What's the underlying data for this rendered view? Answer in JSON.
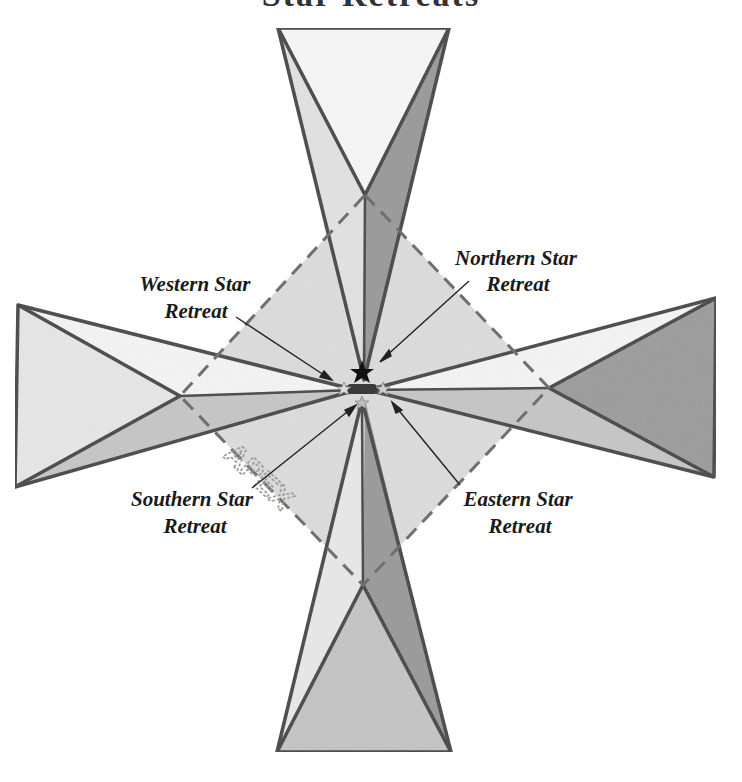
{
  "title": "Star Retreats",
  "diagram": {
    "center": [
      362,
      390
    ],
    "apex_label": "APEX",
    "colors": {
      "outline": "#444444",
      "light": "#e8e8e8",
      "lighter": "#f4f4f4",
      "mid": "#c4c4c4",
      "dark": "#8f8f8f",
      "diamond": "#dadada",
      "dashed": "#6a6a6a"
    },
    "labels": [
      {
        "id": "northern",
        "line1": "Northern Star",
        "line2": "Retreat"
      },
      {
        "id": "western",
        "line1": "Western Star",
        "line2": "Retreat"
      },
      {
        "id": "southern",
        "line1": "Southern Star",
        "line2": "Retreat"
      },
      {
        "id": "eastern",
        "line1": "Eastern Star",
        "line2": "Retreat"
      }
    ]
  }
}
